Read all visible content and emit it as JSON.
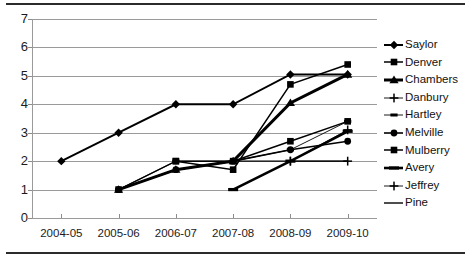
{
  "chart_data": {
    "type": "line",
    "title": "",
    "xlabel": "",
    "ylabel": "",
    "categories": [
      "2004-05",
      "2005-06",
      "2006-07",
      "2007-08",
      "2008-09",
      "2009-10"
    ],
    "ylim": [
      0,
      7
    ],
    "ytick_labels": [
      "0",
      "1",
      "2",
      "3",
      "4",
      "5",
      "6",
      "7"
    ],
    "ytick_values": [
      0,
      1,
      2,
      3,
      4,
      5,
      6,
      7
    ],
    "grid": true,
    "legend_position": "right",
    "series": [
      {
        "name": "Saylor",
        "marker": "diamond",
        "values": [
          2,
          3,
          4,
          4,
          5.05,
          5.05
        ]
      },
      {
        "name": "Denver",
        "marker": "square",
        "values": [
          null,
          null,
          2,
          1.7,
          4.7,
          5.4
        ]
      },
      {
        "name": "Chambers",
        "marker": "triangle",
        "values": [
          null,
          1,
          1.7,
          2,
          4.05,
          5.05
        ]
      },
      {
        "name": "Danbury",
        "marker": "cross",
        "values": [
          null,
          null,
          null,
          null,
          2,
          3.1
        ]
      },
      {
        "name": "Hartley",
        "marker": "dash",
        "values": [
          null,
          1,
          2,
          2,
          2.4,
          3.4
        ]
      },
      {
        "name": "Melville",
        "marker": "circle",
        "values": [
          null,
          1,
          1.7,
          2,
          2.4,
          2.7
        ]
      },
      {
        "name": "Mulberry",
        "marker": "square",
        "values": [
          null,
          1,
          2,
          2,
          2.7,
          3.4
        ]
      },
      {
        "name": "Avery",
        "marker": "thickline",
        "values": [
          null,
          null,
          null,
          1,
          2,
          3.05
        ]
      },
      {
        "name": "Jeffrey",
        "marker": "plus",
        "values": [
          null,
          null,
          null,
          null,
          2,
          2
        ]
      },
      {
        "name": "Pine",
        "marker": "line",
        "values": [
          null,
          null,
          null,
          2,
          2,
          2
        ]
      }
    ]
  },
  "legend": {
    "items": [
      {
        "label": "Saylor"
      },
      {
        "label": "Denver"
      },
      {
        "label": "Chambers"
      },
      {
        "label": "Danbury"
      },
      {
        "label": "Hartley"
      },
      {
        "label": "Melville"
      },
      {
        "label": "Mulberry"
      },
      {
        "label": "Avery"
      },
      {
        "label": "Jeffrey"
      },
      {
        "label": "Pine"
      }
    ]
  },
  "colors": {
    "series": "#000000",
    "grid": "#9a9a9a",
    "text": "#1b1b1b",
    "rule": "#2b2b2b",
    "background": "#ffffff"
  }
}
